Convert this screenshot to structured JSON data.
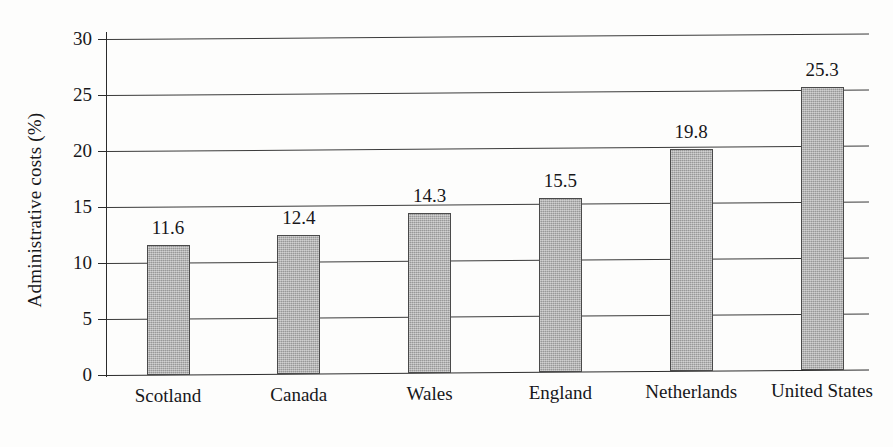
{
  "chart_data": {
    "type": "bar",
    "title": "",
    "xlabel": "",
    "ylabel": "Administrative costs (%)",
    "categories": [
      "Scotland",
      "Canada",
      "Wales",
      "England",
      "Netherlands",
      "United States"
    ],
    "values": [
      11.6,
      12.4,
      14.3,
      15.5,
      19.8,
      25.3
    ],
    "value_labels": [
      "11.6",
      "12.4",
      "14.3",
      "15.5",
      "19.8",
      "25.3"
    ],
    "ylim": [
      0,
      30
    ],
    "yticks": [
      0,
      5,
      10,
      15,
      20,
      25,
      30
    ],
    "ytick_labels": [
      "0",
      "5",
      "10",
      "15",
      "20",
      "25",
      "30"
    ],
    "grid": true,
    "legend": "none",
    "bar_color": "#aaaaaa",
    "bar_edge_color": "#4a4a4a",
    "axis_color": "#2b2b2b",
    "text_color": "#17171a",
    "background": "#fdfdfc"
  }
}
